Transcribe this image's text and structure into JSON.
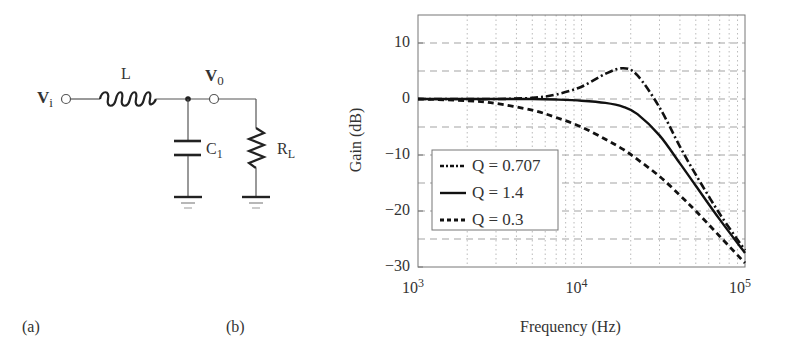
{
  "panel_a": {
    "label": "(a)",
    "circuit": {
      "input_node": "V",
      "input_sub": "i",
      "output_node": "V",
      "output_sub": "0",
      "inductor": "L",
      "capacitor": "C",
      "capacitor_sub": "1",
      "resistor": "R",
      "resistor_sub": "L"
    }
  },
  "panel_b": {
    "label": "(b)"
  },
  "chart_data": {
    "type": "line",
    "title": "",
    "xlabel": "Frequency (Hz)",
    "ylabel": "Gain (dB)",
    "xscale": "log",
    "xlim": [
      1000,
      100000
    ],
    "ylim": [
      -30,
      15
    ],
    "x_ticks": [
      {
        "base": "10",
        "exp": "3"
      },
      {
        "base": "10",
        "exp": "4"
      },
      {
        "base": "10",
        "exp": "5"
      }
    ],
    "y_ticks": [
      "10",
      "0",
      "−10",
      "−20",
      "−30"
    ],
    "grid": {
      "major_y_step": 5,
      "style": "dashed",
      "minor_x": "dotted"
    },
    "legend_position": "lower left",
    "legend": [
      {
        "label": "Q = 0.707",
        "style": "dash-dot"
      },
      {
        "label": "Q = 1.4",
        "style": "solid"
      },
      {
        "label": "Q = 0.3",
        "style": "dashed"
      }
    ],
    "x": [
      1000,
      2000,
      3000,
      5000,
      7000,
      10000,
      14000,
      18000,
      22000,
      30000,
      40000,
      50000,
      70000,
      100000
    ],
    "series": [
      {
        "name": "Q = 0.707",
        "style": "dash-dot",
        "values": [
          0,
          0,
          0,
          0.2,
          0.8,
          2.2,
          4.5,
          5.5,
          4.2,
          -1.5,
          -8.5,
          -13.5,
          -20.5,
          -27.0
        ]
      },
      {
        "name": "Q = 1.4",
        "style": "solid",
        "values": [
          0,
          0,
          0,
          0,
          -0.1,
          -0.3,
          -0.7,
          -1.4,
          -2.7,
          -6.5,
          -11.5,
          -15.5,
          -21.5,
          -27.5
        ]
      },
      {
        "name": "Q = 0.3",
        "style": "dashed",
        "values": [
          0,
          -0.3,
          -0.8,
          -2.0,
          -3.3,
          -5.0,
          -7.2,
          -9.0,
          -10.8,
          -13.8,
          -17.2,
          -20.0,
          -24.5,
          -29.3
        ]
      }
    ]
  }
}
